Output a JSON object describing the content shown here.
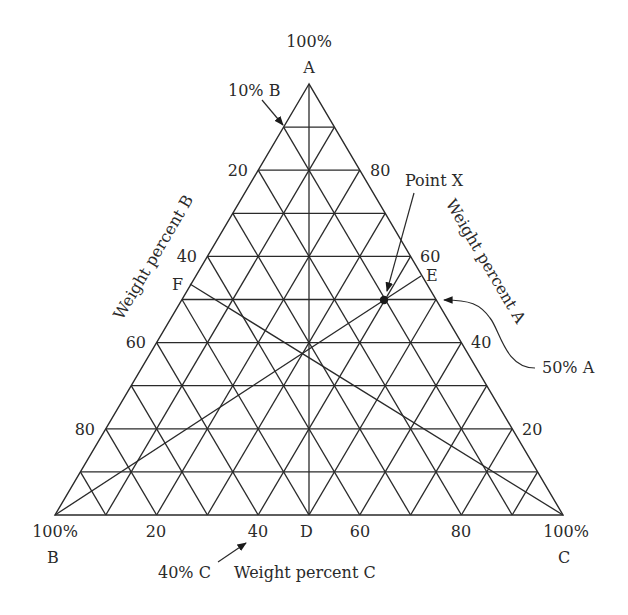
{
  "chart_data": {
    "type": "ternary",
    "title": "",
    "vertices": {
      "top": {
        "name": "A",
        "label": "100%"
      },
      "bottom_left": {
        "name": "B",
        "label": "100%"
      },
      "bottom_right": {
        "name": "C",
        "label": "100%"
      }
    },
    "axes": {
      "A": {
        "label": "Weight percent A",
        "ticks": [
          "80",
          "60",
          "40",
          "20"
        ],
        "side": "right"
      },
      "B": {
        "label": "Weight percent B",
        "ticks": [
          "20",
          "40",
          "60",
          "80"
        ],
        "side": "left"
      },
      "C": {
        "label": "Weight percent C",
        "ticks": [
          "20",
          "40",
          "60",
          "80"
        ],
        "side": "bottom"
      }
    },
    "grid_divisions": 10,
    "grid": true,
    "points": [
      {
        "name": "Point X",
        "A": 50,
        "B": 10,
        "C": 40
      }
    ],
    "construction_lines": [
      {
        "from": "B",
        "to": "E",
        "through": "Point X"
      },
      {
        "from": "C",
        "to": "F"
      },
      {
        "from": "A",
        "to": "D"
      }
    ],
    "annotations": [
      {
        "text": "10% B",
        "target": "left edge 10% gridline"
      },
      {
        "text": "40% C",
        "target": "bottom tick 40"
      },
      {
        "text": "50% A",
        "target": "right edge 50% gridline"
      },
      {
        "text": "Point X",
        "target": "Point X"
      }
    ],
    "edge_labels": [
      "D",
      "E",
      "F"
    ]
  },
  "labels": {
    "apex_pct": "100%",
    "apex_name": "A",
    "b_pct": "100%",
    "b_name": "B",
    "c_pct": "100%",
    "c_name": "C",
    "axis_a": "Weight percent A",
    "axis_b": "Weight percent B",
    "axis_c": "Weight percent C",
    "point_x": "Point X",
    "ann_10b": "10% B",
    "ann_40c": "40% C",
    "ann_50a": "50% A",
    "pt_d": "D",
    "pt_e": "E",
    "pt_f": "F",
    "tick_b20": "20",
    "tick_b40": "40",
    "tick_b60": "60",
    "tick_b80": "80",
    "tick_a80": "80",
    "tick_a60": "60",
    "tick_a40": "40",
    "tick_a20": "20",
    "tick_c20": "20",
    "tick_c40": "40",
    "tick_c60": "60",
    "tick_c80": "80"
  }
}
